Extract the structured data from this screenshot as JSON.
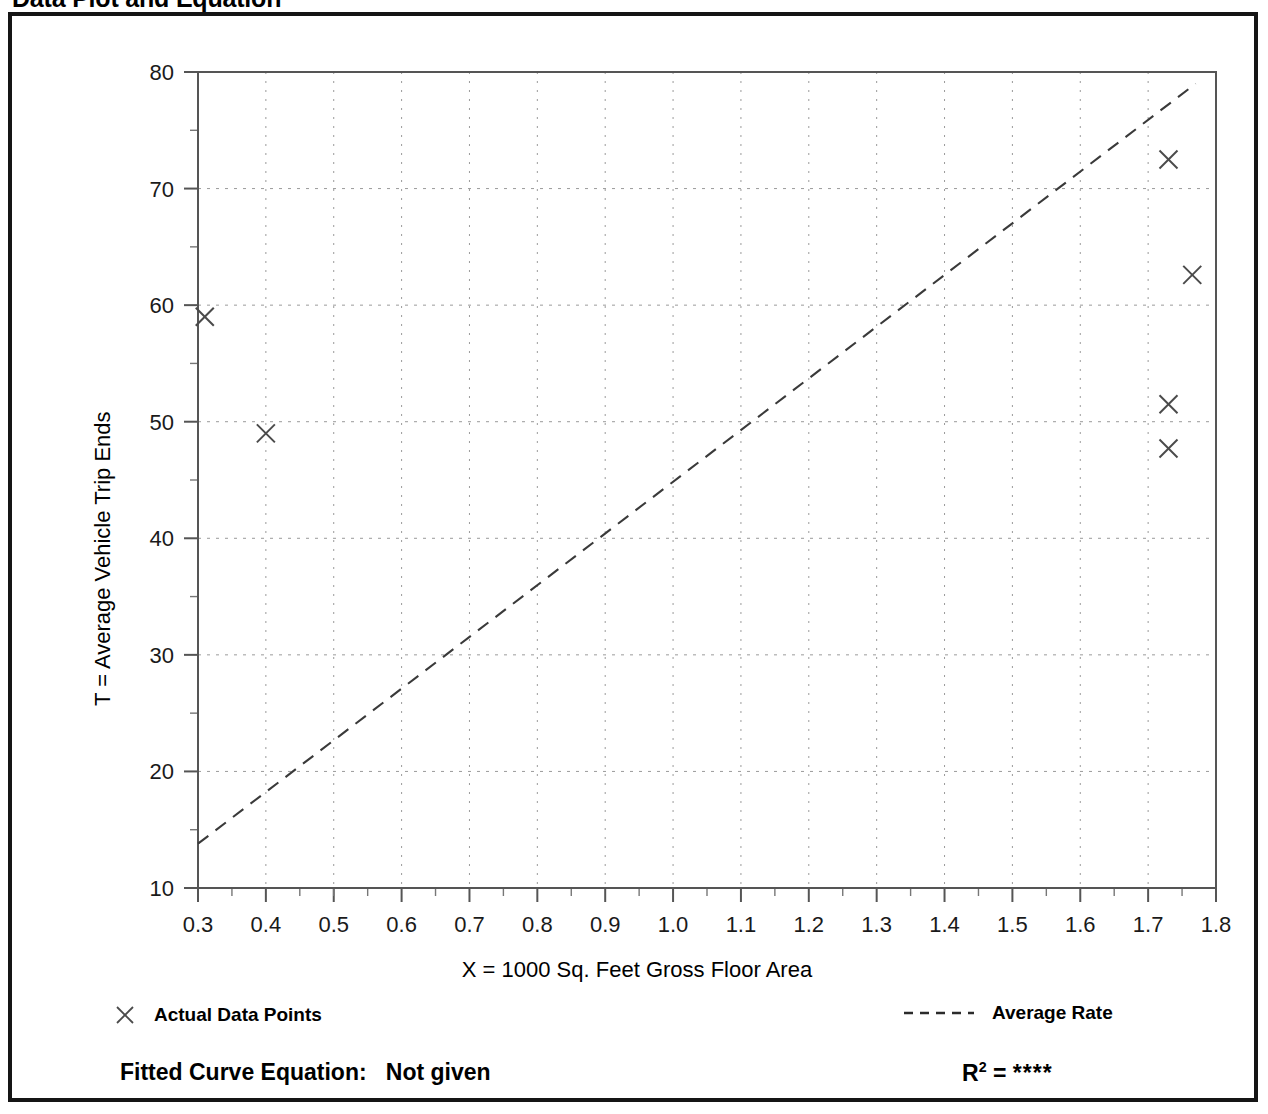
{
  "page": {
    "title": "Data Plot and Equation"
  },
  "chart_data": {
    "type": "scatter",
    "title": "Data Plot and Equation",
    "xlabel": "X = 1000 Sq. Feet Gross Floor Area",
    "ylabel": "T = Average Vehicle Trip Ends",
    "xlim": [
      0.3,
      1.8
    ],
    "ylim": [
      10,
      80
    ],
    "xticks": [
      "0.3",
      "0.4",
      "0.5",
      "0.6",
      "0.7",
      "0.8",
      "0.9",
      "1.0",
      "1.1",
      "1.2",
      "1.3",
      "1.4",
      "1.5",
      "1.6",
      "1.7",
      "1.8"
    ],
    "xtick_values": [
      0.3,
      0.4,
      0.5,
      0.6,
      0.7,
      0.8,
      0.9,
      1.0,
      1.1,
      1.2,
      1.3,
      1.4,
      1.5,
      1.6,
      1.7,
      1.8
    ],
    "yticks": [
      "10",
      "20",
      "30",
      "40",
      "50",
      "60",
      "70",
      "80"
    ],
    "ytick_values": [
      10,
      20,
      30,
      40,
      50,
      60,
      70,
      80
    ],
    "x_minor_step": 0.05,
    "y_minor_step": 5,
    "grid": true,
    "grid_style": "dotted",
    "series": [
      {
        "name": "Actual Data Points",
        "type": "scatter",
        "marker": "x",
        "points": [
          {
            "x": 0.31,
            "y": 59.0
          },
          {
            "x": 0.4,
            "y": 49.0
          },
          {
            "x": 1.73,
            "y": 72.5
          },
          {
            "x": 1.765,
            "y": 62.6
          },
          {
            "x": 1.73,
            "y": 51.5
          },
          {
            "x": 1.73,
            "y": 47.7
          }
        ]
      },
      {
        "name": "Average Rate",
        "type": "line",
        "style": "dashed",
        "endpoints": [
          {
            "x": 0.3,
            "y": 13.8
          },
          {
            "x": 1.77,
            "y": 79.0
          }
        ]
      }
    ],
    "legend_position": "below-axes"
  },
  "legend": {
    "data_points_label": "Actual Data Points",
    "data_points_marker": "x-marker-icon",
    "average_rate_label": "Average Rate",
    "average_rate_marker": "dashed-line-icon"
  },
  "footer": {
    "equation_label": "Fitted Curve Equation:",
    "equation_value": "Not given",
    "r2_symbol": "R",
    "r2_exponent": "2",
    "r2_equals": "=",
    "r2_value": "****"
  },
  "colors": {
    "frame": "#151515",
    "axis": "#555555",
    "grid": "#9a9a9a",
    "marker": "#4a4a4a",
    "trend": "#3a3a3a",
    "text": "#000000"
  }
}
